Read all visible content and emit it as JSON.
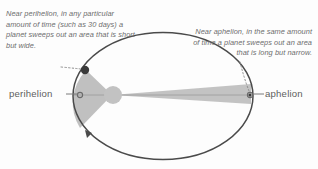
{
  "figure": {
    "background_color": "#fdfdfd",
    "captions": {
      "perihelion_note": "Near perihelion, in any particular amount of time (such as 30 days) a planet sweeps out an area that is short but wide.",
      "aphelion_note": "Near aphelion, in the same amount of time a planet sweeps out an area that is long but narrow."
    },
    "labels": {
      "perihelion": "perihelion",
      "aphelion": "aphelion"
    },
    "colors": {
      "orbit_stroke": "#4a4a4a",
      "caption_text": "#6d6d6d",
      "label_text": "#5e5e5e",
      "sector_fill": "#b9b9b9",
      "sun_fill": "#c2c2c2",
      "planet_dot": "#3a3a3a",
      "leader_line": "#7a7a7a",
      "dotted_leader": "#8d8d8d"
    },
    "elements": {
      "orbit_name": "elliptical-orbit",
      "sun_name": "sun",
      "perihelion_sector_name": "perihelion-swept-sector",
      "aphelion_sector_name": "aphelion-swept-sector",
      "direction_arrow_name": "orbit-direction-arrow",
      "perihelion_planet_name": "planet-at-perihelion",
      "aphelion_planet_name": "planet-at-aphelion"
    }
  }
}
